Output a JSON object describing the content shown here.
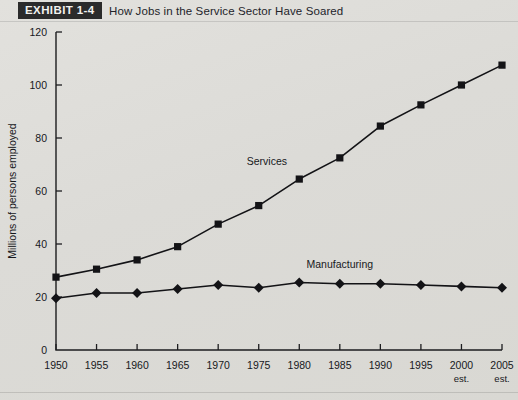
{
  "exhibit": {
    "tag": "EXHIBIT 1-4",
    "title": "How Jobs in the Service Sector Have Soared"
  },
  "chart_data": {
    "type": "line",
    "title": "How Jobs in the Service Sector Have Soared",
    "xlabel": "",
    "ylabel": "Millions of persons employed",
    "xlim": [
      1950,
      2005
    ],
    "ylim": [
      0,
      120
    ],
    "ytick_step": 20,
    "yticks": [
      0,
      20,
      40,
      60,
      80,
      100,
      120
    ],
    "grid": false,
    "legend": "inline-annotations",
    "categories": [
      "1950",
      "1955",
      "1960",
      "1965",
      "1970",
      "1975",
      "1980",
      "1985",
      "1990",
      "1995",
      "2000",
      "2005"
    ],
    "xtick_sublabels": [
      "",
      "",
      "",
      "",
      "",
      "",
      "",
      "",
      "",
      "",
      "est.",
      "est."
    ],
    "series": [
      {
        "name": "Services",
        "marker": "square",
        "color": "#131316",
        "label_x": 1976,
        "label_y": 70,
        "values": [
          27.5,
          30.5,
          34,
          39,
          47.5,
          54.5,
          64.5,
          72.5,
          84.5,
          92.5,
          100,
          107.5
        ]
      },
      {
        "name": "Manufacturing",
        "marker": "diamond",
        "color": "#131316",
        "label_x": 1985,
        "label_y": 31,
        "values": [
          19.5,
          21.5,
          21.5,
          23,
          24.5,
          23.5,
          25.5,
          25,
          25,
          24.5,
          24,
          23.5
        ]
      }
    ]
  }
}
